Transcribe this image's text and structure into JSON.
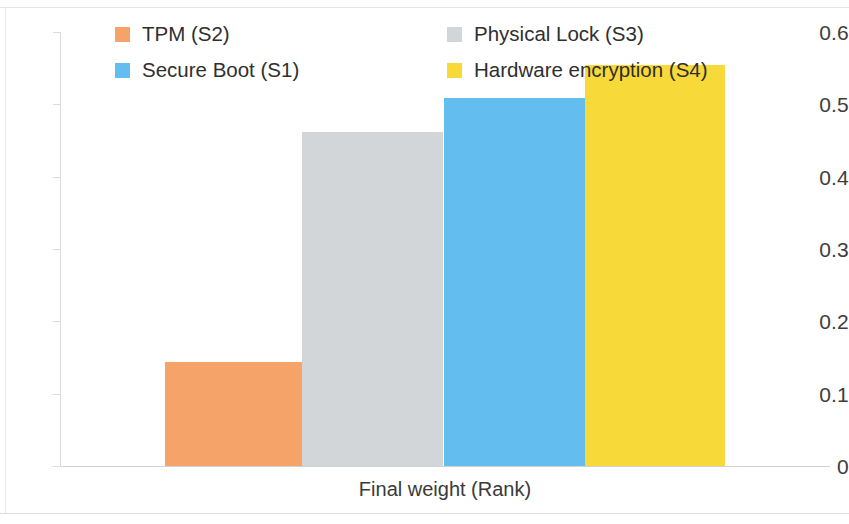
{
  "chart_data": {
    "type": "bar",
    "title": "",
    "xlabel": "Final weight (Rank)",
    "ylabel": "",
    "categories": [
      "TPM (S2)",
      "Physical Lock (S3)",
      "Secure Boot (S1)",
      "Hardware encryption (S4)"
    ],
    "values": [
      0.144,
      0.462,
      0.509,
      0.554
    ],
    "colors": [
      "#F5A368",
      "#D3D6D8",
      "#63BDEF",
      "#F8D93A"
    ],
    "ylim": [
      0,
      0.6
    ],
    "ytick_labels": [
      "0.6",
      "0.5",
      "0.4",
      "0.3",
      "0.2",
      "0.1",
      "0"
    ],
    "ytick_values": [
      0.6,
      0.5,
      0.4,
      0.3,
      0.2,
      0.1,
      0
    ],
    "grid": false,
    "legend_position": "top",
    "legend": [
      {
        "label": "TPM (S2)",
        "color": "#F5A368"
      },
      {
        "label": "Physical Lock (S3)",
        "color": "#D3D6D8"
      },
      {
        "label": "Secure Boot (S1)",
        "color": "#63BDEF"
      },
      {
        "label": "Hardware encryption (S4)",
        "color": "#F8D93A"
      }
    ],
    "bars": [
      {
        "label": "TPM (S2)",
        "value": 0.144,
        "color": "#F5A368",
        "left": 105,
        "width": 140
      },
      {
        "label": "Physical Lock (S3)",
        "value": 0.462,
        "color": "#D3D6D8",
        "left": 242,
        "width": 141
      },
      {
        "label": "Secure Boot (S1)",
        "value": 0.509,
        "color": "#63BDEF",
        "left": 384,
        "width": 141
      },
      {
        "label": "Hardware encryption (S4)",
        "value": 0.554,
        "color": "#F8D93A",
        "left": 525,
        "width": 140
      }
    ]
  },
  "legend_layout": [
    {
      "index": 0,
      "left": 115,
      "top": 24
    },
    {
      "index": 1,
      "left": 447,
      "top": 24
    },
    {
      "index": 2,
      "left": 115,
      "top": 60
    },
    {
      "index": 3,
      "left": 447,
      "top": 60
    }
  ],
  "axis": {
    "x_title": "Final weight (Rank)"
  }
}
